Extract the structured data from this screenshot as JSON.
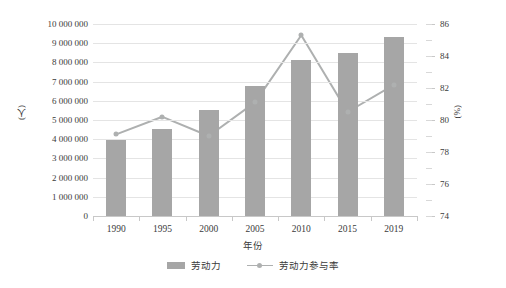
{
  "chart_data": {
    "type": "bar",
    "title": "",
    "subtitle": "",
    "xlabel": "年份",
    "ylabel": "(人)",
    "y2label": "(%)",
    "categories": [
      "1990",
      "1995",
      "2000",
      "2005",
      "2010",
      "2015",
      "2019"
    ],
    "series": [
      {
        "name": "劳动力",
        "type": "bar",
        "axis": "left",
        "color": "#a6a6a6",
        "values": [
          3950000,
          4550000,
          5500000,
          6750000,
          8100000,
          8500000,
          9300000
        ]
      },
      {
        "name": "劳动力参与率",
        "type": "line",
        "axis": "right",
        "color": "#aeb0b0",
        "values": [
          79.1,
          80.2,
          79.0,
          81.1,
          85.3,
          80.5,
          82.2
        ]
      }
    ],
    "ylim": [
      0,
      10000000
    ],
    "yticks": [
      "0",
      "1 000 000",
      "2 000 000",
      "3 000 000",
      "4 000 000",
      "5 000 000",
      "6 000 000",
      "7 000 000",
      "8 000 000",
      "9 000 000",
      "10 000 000"
    ],
    "ytick_values": [
      0,
      1000000,
      2000000,
      3000000,
      4000000,
      5000000,
      6000000,
      7000000,
      8000000,
      9000000,
      10000000
    ],
    "y2lim": [
      74,
      86
    ],
    "y2ticks": [
      "74",
      "76",
      "78",
      "80",
      "82",
      "84",
      "86"
    ],
    "y2tick_values": [
      74,
      76,
      78,
      80,
      82,
      84,
      86
    ],
    "grid": true,
    "legend_position": "bottom",
    "legend": [
      "劳动力",
      "劳动力参与率"
    ]
  }
}
